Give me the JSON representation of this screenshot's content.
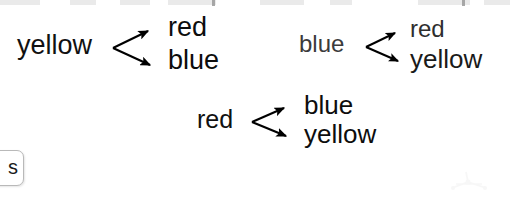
{
  "canvas": {
    "width": 510,
    "height": 197,
    "background": "#ffffff"
  },
  "diagram": {
    "type": "branching-arrow-diagram",
    "arrow_color": "#000000",
    "groups": [
      {
        "id": "group-1",
        "source": "yellow",
        "targets": [
          "red",
          "blue"
        ],
        "text_color": "#111111",
        "arrow_count": 2
      },
      {
        "id": "group-2",
        "source": "blue",
        "targets": [
          "red",
          "yellow"
        ],
        "text_color": "#3b3b3b",
        "arrow_count": 2
      },
      {
        "id": "group-3",
        "source": "red",
        "targets": [
          "blue",
          "yellow"
        ],
        "text_color": "#111111",
        "arrow_count": 2
      }
    ]
  },
  "clipped_button": {
    "label": "s",
    "note": "button cropped by the left edge of the screenshot"
  },
  "top_artifacts": [
    {
      "left": 0,
      "width": 40
    },
    {
      "left": 70,
      "width": 26
    },
    {
      "left": 120,
      "width": 30
    },
    {
      "left": 168,
      "width": 48
    },
    {
      "left": 260,
      "width": 44
    },
    {
      "left": 330,
      "width": 22
    },
    {
      "left": 418,
      "width": 52
    },
    {
      "left": 484,
      "width": 26
    }
  ],
  "top_ticks": [
    {
      "left": 212
    },
    {
      "left": 462
    }
  ]
}
